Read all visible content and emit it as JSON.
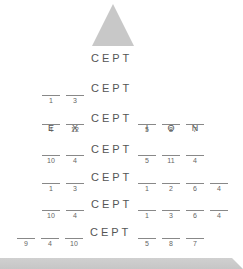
{
  "diagram": {
    "root_word": "CEPT",
    "triangle_color": "#c8c8c8",
    "rows": [
      {
        "prefix": [
          {
            "letter": "",
            "num": "1"
          },
          {
            "letter": "",
            "num": "3"
          }
        ],
        "word": "CEPT",
        "suffix": []
      },
      {
        "prefix": [
          {
            "letter": "E",
            "num": "4"
          },
          {
            "letter": "X",
            "num": "12"
          }
        ],
        "word": "CEPT",
        "suffix": [
          {
            "letter": "I",
            "num": "5"
          },
          {
            "letter": "O",
            "num": "8"
          },
          {
            "letter": "N",
            "num": "7"
          }
        ]
      },
      {
        "prefix": [
          {
            "letter": "",
            "num": "10"
          },
          {
            "letter": "",
            "num": "4"
          }
        ],
        "word": "CEPT",
        "suffix": [
          {
            "letter": "",
            "num": "5"
          },
          {
            "letter": "",
            "num": "11"
          },
          {
            "letter": "",
            "num": "4"
          }
        ]
      },
      {
        "prefix": [
          {
            "letter": "",
            "num": "1"
          },
          {
            "letter": "",
            "num": "3"
          }
        ],
        "word": "CEPT",
        "suffix": [
          {
            "letter": "",
            "num": "1"
          },
          {
            "letter": "",
            "num": "2"
          },
          {
            "letter": "",
            "num": "6"
          },
          {
            "letter": "",
            "num": "4"
          }
        ]
      },
      {
        "prefix": [
          {
            "letter": "",
            "num": "10"
          },
          {
            "letter": "",
            "num": "4"
          }
        ],
        "word": "CEPT",
        "suffix": [
          {
            "letter": "",
            "num": "1"
          },
          {
            "letter": "",
            "num": "3"
          },
          {
            "letter": "",
            "num": "6"
          },
          {
            "letter": "",
            "num": "4"
          }
        ]
      },
      {
        "prefix": [
          {
            "letter": "",
            "num": "9"
          },
          {
            "letter": "",
            "num": "4"
          },
          {
            "letter": "",
            "num": "10"
          }
        ],
        "word": "CEPT",
        "suffix": [
          {
            "letter": "",
            "num": "5"
          },
          {
            "letter": "",
            "num": "8"
          },
          {
            "letter": "",
            "num": "7"
          }
        ]
      }
    ]
  }
}
